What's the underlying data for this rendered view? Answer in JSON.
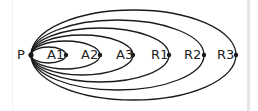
{
  "diagram": {
    "type": "nested-arc-diagram",
    "origin": {
      "label": "P",
      "x": 31,
      "y": 55
    },
    "nodes": [
      {
        "label": "A1",
        "x": 66,
        "label_x": 47,
        "ry": 8
      },
      {
        "label": "A2",
        "x": 100,
        "label_x": 81,
        "ry": 14
      },
      {
        "label": "A3",
        "x": 133,
        "label_x": 116,
        "ry": 20
      },
      {
        "label": "R1",
        "x": 169,
        "label_x": 151,
        "ry": 27
      },
      {
        "label": "R2",
        "x": 204,
        "label_x": 184,
        "ry": 35
      },
      {
        "label": "R3",
        "x": 236,
        "label_x": 217,
        "ry": 45
      }
    ],
    "line_color": "#1a1a1a"
  }
}
